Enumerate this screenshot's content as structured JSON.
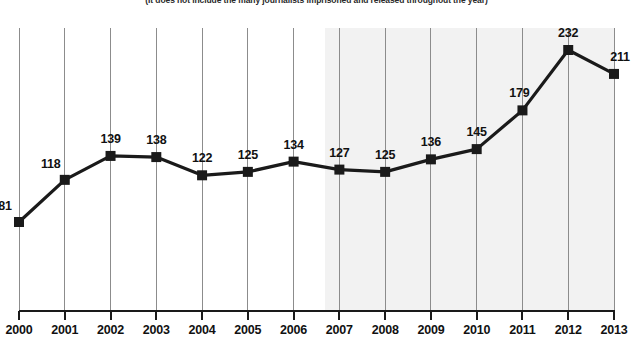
{
  "caption": "(It does not include the many journalists imprisoned and released throughout the year)",
  "colors": {
    "line": "#1a1a1a",
    "marker": "#1a1a1a",
    "gridline": "#8c8c8c",
    "axis": "#1a1a1a",
    "shade": "#f2f2f2",
    "label_text": "#111111",
    "background": "#ffffff"
  },
  "chart_data": {
    "type": "line",
    "title": "",
    "subtitle": "(It does not include the many journalists imprisoned and released throughout the year)",
    "xlabel": "",
    "ylabel": "",
    "categories": [
      "2000",
      "2001",
      "2002",
      "2003",
      "2004",
      "2005",
      "2006",
      "2007",
      "2008",
      "2009",
      "2010",
      "2011",
      "2012",
      "2013"
    ],
    "values": [
      81,
      118,
      139,
      138,
      122,
      125,
      134,
      127,
      125,
      136,
      145,
      179,
      232,
      211
    ],
    "data_labels": [
      "81",
      "118",
      "139",
      "138",
      "122",
      "125",
      "134",
      "127",
      "125",
      "136",
      "145",
      "179",
      "232",
      "211"
    ],
    "series": [
      {
        "name": "Journalists imprisoned",
        "values": [
          81,
          118,
          139,
          138,
          122,
          125,
          134,
          127,
          125,
          136,
          145,
          179,
          232,
          211
        ],
        "marker": "square",
        "color": "#1a1a1a"
      }
    ],
    "ylim": [
      0,
      260
    ],
    "yticks": [],
    "grid": "vertical",
    "legend": "none",
    "shaded_region": {
      "from_category": "2007",
      "to_category": "2013",
      "color": "#f2f2f2"
    }
  }
}
